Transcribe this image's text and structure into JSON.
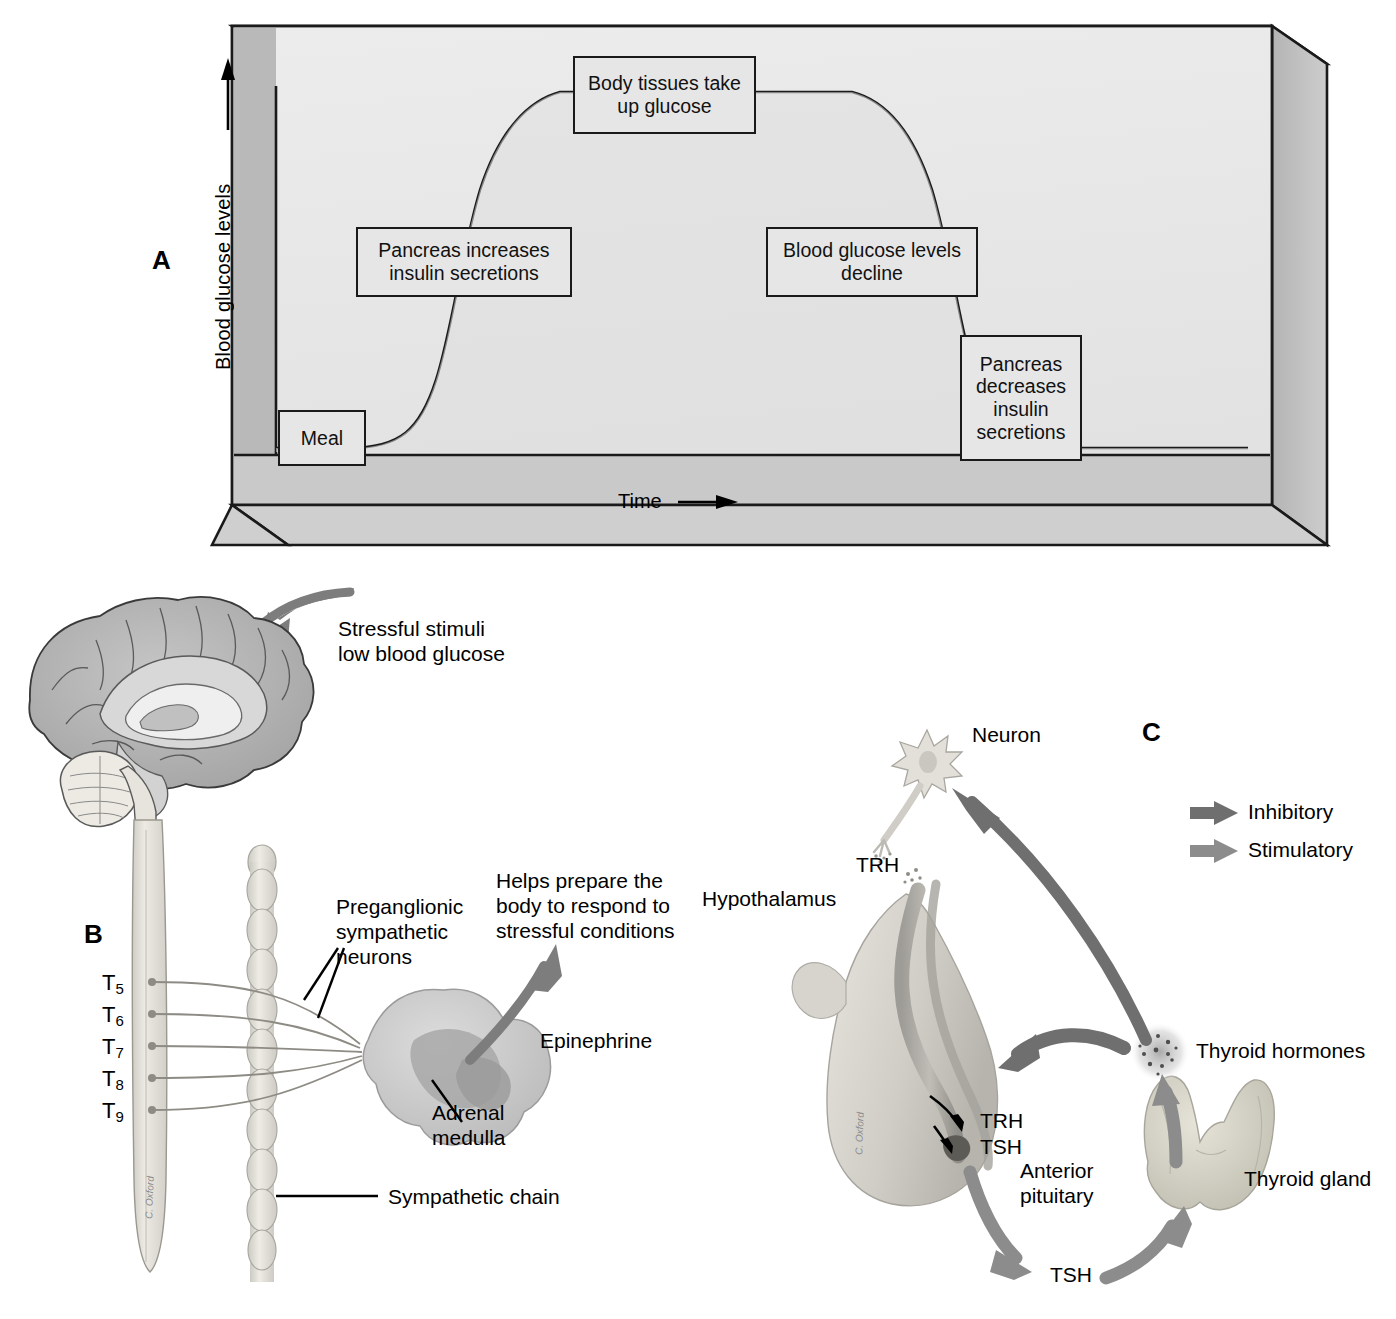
{
  "figure": {
    "panels": [
      "A",
      "B",
      "C"
    ]
  },
  "panel_a": {
    "letter": "A",
    "y_axis_label": "Blood glucose levels",
    "x_axis_label": "Time",
    "x_axis_arrow": "⟶",
    "y_axis_arrow": "up-arrow",
    "boxes": [
      {
        "id": "meal",
        "text": "Meal"
      },
      {
        "id": "pancreas_increases",
        "text": "Pancreas increases\ninsulin secretions"
      },
      {
        "id": "body_tissues",
        "text": "Body tissues\ntake up glucose"
      },
      {
        "id": "glucose_decline",
        "text": "Blood glucose\nlevels decline"
      },
      {
        "id": "pancreas_decreases",
        "text": "Pancreas\ndecreases\ninsulin\nsecretions"
      }
    ],
    "colors": {
      "panel_face": "#e8e8e8",
      "panel_side": "#b9b9b9",
      "panel_floor": "#c9c9c9",
      "curve": "#1a1a1a",
      "box_fill": "#e6e6e6",
      "box_border": "#1a1a1a"
    }
  },
  "chart_data": {
    "type": "line",
    "title": "",
    "xlabel": "Time",
    "ylabel": "Blood glucose levels",
    "grid": false,
    "legend": "none",
    "annotations": [
      "Meal",
      "Pancreas increases insulin secretions",
      "Body tissues take up glucose",
      "Blood glucose levels decline",
      "Pancreas decreases insulin secretions"
    ],
    "series": [
      {
        "name": "Blood glucose level after a meal",
        "x": [
          0,
          4,
          8,
          12,
          16,
          20,
          24,
          28,
          32,
          36,
          40,
          44,
          48,
          52,
          56,
          60,
          64,
          68,
          72,
          76,
          80,
          84,
          88,
          92,
          96,
          100
        ],
        "values": [
          4,
          4,
          4.5,
          6,
          11,
          22,
          38,
          56,
          72,
          84,
          92,
          97,
          99,
          99,
          97,
          92,
          84,
          72,
          56,
          38,
          22,
          11,
          6,
          4.5,
          4,
          4
        ]
      }
    ],
    "xlim": [
      0,
      100
    ],
    "ylim": [
      0,
      100
    ]
  },
  "panel_b": {
    "letter": "B",
    "labels": {
      "stimulus": "Stressful stimuli\nlow blood glucose",
      "preganglionic": "Preganglionic\nsympathetic\nneurons",
      "helps_prepare": "Helps prepare the\nbody to respond to\nstressful conditions",
      "epinephrine": "Epinephrine",
      "adrenal_medulla": "Adrenal\nmedulla",
      "sympathetic_chain": "Sympathetic chain"
    },
    "spinal_levels": [
      "T5",
      "T6",
      "T7",
      "T8",
      "T9"
    ],
    "artist_signature": "C. Oxford",
    "colors": {
      "brain": "#b0b0b0",
      "cord": "#e0dfd9",
      "arrow_gray": "#7d7d7d",
      "adrenal": "#c9c9c9"
    }
  },
  "panel_c": {
    "letter": "C",
    "labels": {
      "neuron": "Neuron",
      "trh_neuron": "TRH",
      "hypothalamus": "Hypothalamus",
      "trh_pituitary": "TRH",
      "tsh_pituitary": "TSH",
      "anterior_pituitary": "Anterior\npituitary",
      "tsh": "TSH",
      "thyroid_gland": "Thyroid gland",
      "thyroid_hormones": "Thyroid hormones"
    },
    "legend": [
      {
        "label": "Inhibitory",
        "color": "#6f6f6f"
      },
      {
        "label": "Stimulatory",
        "color": "#8c8c8c"
      }
    ],
    "artist_signature": "C. Oxford"
  }
}
